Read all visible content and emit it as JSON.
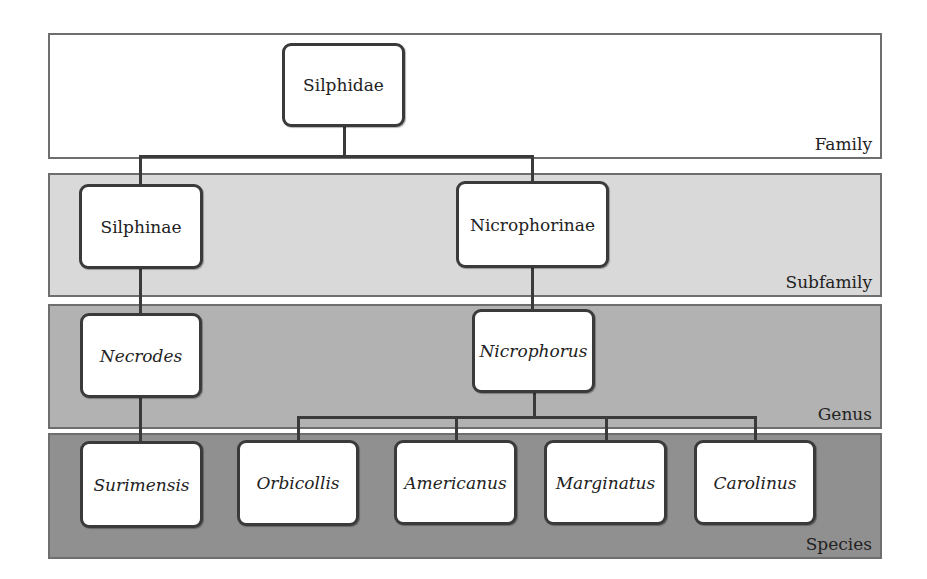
{
  "diagram": {
    "type": "taxonomy-tree",
    "levels": [
      {
        "name": "Family",
        "color": "#ffffff"
      },
      {
        "name": "Subfamily",
        "color": "#d9d9d9"
      },
      {
        "name": "Genus",
        "color": "#b2b2b2"
      },
      {
        "name": "Species",
        "color": "#909090"
      }
    ],
    "nodes": {
      "family": "Silphidae",
      "subfamily_1": "Silphinae",
      "subfamily_2": "Nicrophorinae",
      "genus_1": "Necrodes",
      "genus_2": "Nicrophorus",
      "species": [
        "Surimensis",
        "Orbicollis",
        "Americanus",
        "Marginatus",
        "Carolinus"
      ]
    },
    "edges": [
      [
        "Silphidae",
        "Silphinae"
      ],
      [
        "Silphidae",
        "Nicrophorinae"
      ],
      [
        "Silphinae",
        "Necrodes"
      ],
      [
        "Nicrophorinae",
        "Nicrophorus"
      ],
      [
        "Necrodes",
        "Surimensis"
      ],
      [
        "Nicrophorus",
        "Orbicollis"
      ],
      [
        "Nicrophorus",
        "Americanus"
      ],
      [
        "Nicrophorus",
        "Marginatus"
      ],
      [
        "Nicrophorus",
        "Carolinus"
      ]
    ]
  }
}
